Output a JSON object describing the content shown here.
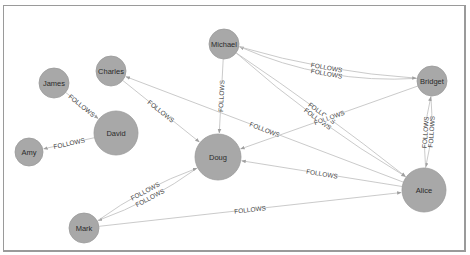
{
  "graph": {
    "relationship_label": "FOLLOWS",
    "colors": {
      "node_fill": "#a8a8a8",
      "edge": "#c4c4c4",
      "border": "#9a9a9a"
    },
    "nodes": [
      {
        "id": "michael",
        "label": "Michael",
        "x": 224,
        "y": 44,
        "r": 15
      },
      {
        "id": "charles",
        "label": "Charles",
        "x": 111,
        "y": 71,
        "r": 15
      },
      {
        "id": "james",
        "label": "James",
        "x": 54,
        "y": 83,
        "r": 15
      },
      {
        "id": "david",
        "label": "David",
        "x": 116,
        "y": 133,
        "r": 22
      },
      {
        "id": "amy",
        "label": "Amy",
        "x": 29,
        "y": 152,
        "r": 14
      },
      {
        "id": "doug",
        "label": "Doug",
        "x": 218,
        "y": 157,
        "r": 23
      },
      {
        "id": "bridget",
        "label": "Bridget",
        "x": 432,
        "y": 81,
        "r": 15
      },
      {
        "id": "alice",
        "label": "Alice",
        "x": 424,
        "y": 190,
        "r": 22
      },
      {
        "id": "mark",
        "label": "Mark",
        "x": 84,
        "y": 228,
        "r": 15
      }
    ],
    "edges": [
      {
        "from": "james",
        "to": "david",
        "label": "FOLLOWS"
      },
      {
        "from": "david",
        "to": "amy",
        "label": "FOLLOWS"
      },
      {
        "from": "charles",
        "to": "doug",
        "label": "FOLLOWS"
      },
      {
        "from": "alice",
        "to": "charles",
        "label": "FOLLOWS"
      },
      {
        "from": "michael",
        "to": "doug",
        "label": "FOLLOWS"
      },
      {
        "from": "bridget",
        "to": "michael",
        "label": "FOLLOWS",
        "curve": -22
      },
      {
        "from": "michael",
        "to": "bridget",
        "label": "FOLLOWS",
        "curve": 10
      },
      {
        "from": "michael",
        "to": "alice",
        "label": "FOLLOWS",
        "curve": -4
      },
      {
        "from": "michael",
        "to": "alice",
        "label": "FOLLOWS",
        "curve": 10
      },
      {
        "from": "bridget",
        "to": "doug",
        "label": "FOLLOWS"
      },
      {
        "from": "alice",
        "to": "doug",
        "label": "FOLLOWS"
      },
      {
        "from": "doug",
        "to": "mark",
        "label": "FOLLOWS",
        "curve": -8
      },
      {
        "from": "mark",
        "to": "doug",
        "label": "FOLLOWS",
        "curve": -8
      },
      {
        "from": "mark",
        "to": "alice",
        "label": "FOLLOWS"
      },
      {
        "from": "bridget",
        "to": "alice",
        "label": "FOLLOWS",
        "curve": -6
      },
      {
        "from": "alice",
        "to": "bridget",
        "label": "FOLLOWS",
        "curve": -6
      }
    ]
  }
}
